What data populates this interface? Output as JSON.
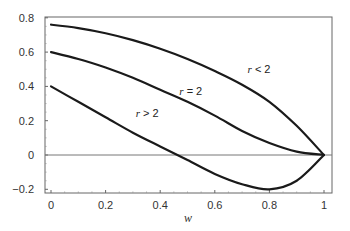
{
  "chart_data": {
    "type": "line",
    "title": "",
    "xlabel": "w",
    "ylabel": "",
    "xlim": [
      0,
      1
    ],
    "ylim": [
      -0.2,
      0.8
    ],
    "x_ticks": [
      0,
      0.2,
      0.4,
      0.6,
      0.8,
      1
    ],
    "x_tick_labels": [
      "0",
      "0.2",
      "0.4",
      "0.6",
      "0.8",
      "1"
    ],
    "y_ticks": [
      -0.2,
      0,
      0.2,
      0.4,
      0.6,
      0.8
    ],
    "y_tick_labels": [
      "−0.2",
      "0",
      "0.2",
      "0.4",
      "0.6",
      "0.8"
    ],
    "grid": false,
    "zero_line": true,
    "legend": "inline labels",
    "x": [
      0,
      0.1,
      0.2,
      0.3,
      0.4,
      0.5,
      0.6,
      0.7,
      0.8,
      0.9,
      1.0
    ],
    "series": [
      {
        "name": "r < 2",
        "label_var": "r",
        "label_rel": "< 2",
        "values": [
          0.76,
          0.74,
          0.71,
          0.67,
          0.62,
          0.56,
          0.49,
          0.41,
          0.31,
          0.17,
          0.0
        ]
      },
      {
        "name": "r = 2",
        "label_var": "r",
        "label_rel": "= 2",
        "values": [
          0.6,
          0.56,
          0.51,
          0.45,
          0.38,
          0.31,
          0.23,
          0.14,
          0.07,
          0.02,
          0.0
        ]
      },
      {
        "name": "r > 2",
        "label_var": "r",
        "label_rel": "> 2",
        "values": [
          0.4,
          0.31,
          0.22,
          0.13,
          0.05,
          -0.03,
          -0.11,
          -0.17,
          -0.2,
          -0.15,
          0.0
        ]
      }
    ],
    "annotations": [
      {
        "text": "r < 2",
        "x": 0.72,
        "y": 0.48
      },
      {
        "text": "r = 2",
        "x": 0.47,
        "y": 0.35
      },
      {
        "text": "r > 2",
        "x": 0.31,
        "y": 0.22
      }
    ]
  },
  "style": {
    "line_color": "#1a1a1a",
    "axis_color": "#666666",
    "zero_line_color": "#777777",
    "text_color": "#333333"
  }
}
